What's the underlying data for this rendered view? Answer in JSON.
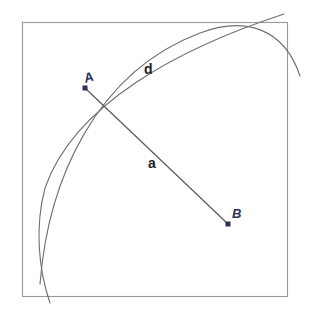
{
  "figure": {
    "kind": "geometry-diagram",
    "background_color": "#ffffff",
    "frame": {
      "name": "square-border",
      "x": 22,
      "y": 22,
      "width": 265,
      "height": 274,
      "stroke_color": "#999999",
      "stroke_width": 1,
      "fill": "none"
    },
    "arc_color": "#6f6f6f",
    "arc_width": 1,
    "chord_color": "#595959",
    "chord_width": 1,
    "point_color": "#2a2f55",
    "points": [
      {
        "label": "A",
        "x": 85,
        "y": 88,
        "marker": "square-dot",
        "marker_size": 5
      },
      {
        "label": "B",
        "x": 228,
        "y": 224,
        "marker": "square-dot",
        "marker_size": 5
      }
    ],
    "arcs": [
      {
        "name": "arc-d",
        "role": "upper-right arc through A and B (arc length d)",
        "start": {
          "x": 40,
          "y": 283
        },
        "end": {
          "x": 289,
          "y": 82
        },
        "apex": {
          "x": 214,
          "y": 27
        },
        "bulge": "outward-up-right"
      },
      {
        "name": "arc-secondary",
        "role": "left-bulging arc crossing the frame near both right-top and bottom-left corners",
        "start": {
          "x": 279,
          "y": 17
        },
        "end": {
          "x": 49,
          "y": 301
        },
        "apex": {
          "x": 41,
          "y": 183
        },
        "bulge": "outward-left"
      }
    ],
    "chord": {
      "name": "segment-a",
      "from": "A",
      "to": "B",
      "x1": 85,
      "y1": 88,
      "x2": 228,
      "y2": 224
    },
    "labels": {
      "vertex_a": "A",
      "vertex_b": "B",
      "arc_label": "d",
      "chord_label": "a"
    }
  }
}
